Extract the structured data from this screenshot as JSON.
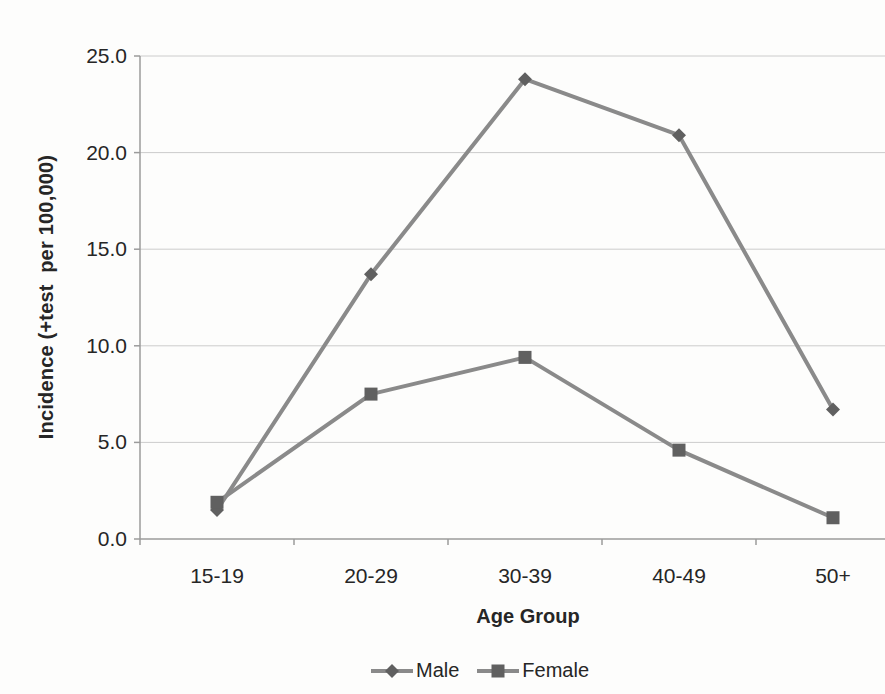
{
  "chart_data": {
    "type": "line",
    "categories": [
      "15-19",
      "20-29",
      "30-39",
      "40-49",
      "50+"
    ],
    "series": [
      {
        "name": "Male",
        "marker": "diamond",
        "values": [
          1.5,
          13.7,
          23.8,
          20.9,
          6.7
        ]
      },
      {
        "name": "Female",
        "marker": "square",
        "values": [
          1.9,
          7.5,
          9.4,
          4.6,
          1.1
        ]
      }
    ],
    "title": "",
    "xlabel": "Age Group",
    "ylabel": "Incidence (+test  per 100,000)",
    "ylim": [
      0,
      25
    ],
    "ytick_step": 5,
    "ytick_labels": [
      "0.0",
      "5.0",
      "10.0",
      "15.0",
      "20.0",
      "25.0"
    ],
    "grid": true,
    "legend_position": "bottom-center"
  },
  "style": {
    "line_color": "#8a8a8a",
    "marker_color": "#606060",
    "gridline_color": "#cccccc",
    "axis_color": "#9b9b9b",
    "text_color": "#262626",
    "background_color": "#fdfdfc"
  }
}
